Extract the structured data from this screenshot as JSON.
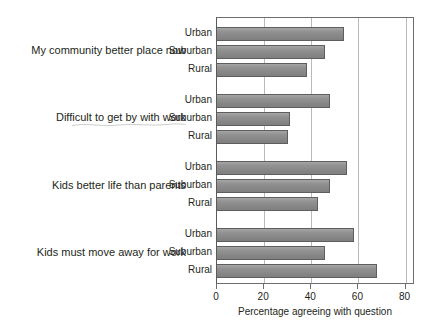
{
  "chart_data": {
    "type": "bar",
    "orientation": "horizontal",
    "title": "",
    "xlabel": "Percentage agreeing with question",
    "ylabel": "",
    "xlim": [
      0,
      84
    ],
    "xticks": [
      0,
      20,
      40,
      60,
      80
    ],
    "xtick_labels": [
      "0",
      "20",
      "40",
      "60",
      "80"
    ],
    "grid": "vertical",
    "legend": "none",
    "categories": [
      "Urban",
      "Suburban",
      "Rural"
    ],
    "groups": [
      {
        "label": "My community better place now",
        "values": [
          54,
          46,
          38
        ]
      },
      {
        "label": "Difficult to get by with work",
        "values": [
          48,
          31,
          30
        ]
      },
      {
        "label": "Kids better life than parents",
        "values": [
          55,
          48,
          43
        ]
      },
      {
        "label": "Kids must move away for work",
        "values": [
          58,
          46,
          68
        ]
      }
    ],
    "bar_color": "#8d8d8d",
    "bar_edge_color": "#5e5e5e",
    "grid_color": "#b9b9b9",
    "axis_color": "#6e6e6e",
    "text_color": "#231f20"
  }
}
